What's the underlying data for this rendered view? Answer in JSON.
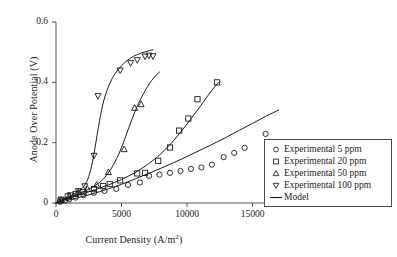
{
  "chart_data": {
    "type": "scatter",
    "title": "",
    "xlabel": "Current Density (A/m2)",
    "xlabel_base": "Current Density (A/m",
    "xlabel_sup": "2",
    "xlabel_tail": ")",
    "ylabel": "Anode Over Potential (V)",
    "xlim": [
      0,
      17500
    ],
    "ylim": [
      0,
      0.6
    ],
    "xticks": [
      0,
      5000,
      10000,
      15000
    ],
    "xtick_labels": [
      "0",
      "5000",
      "10000",
      "15000"
    ],
    "yticks": [
      0,
      0.2,
      0.4,
      0.6
    ],
    "ytick_labels": [
      "0",
      "0.2",
      "0.4",
      "0.6"
    ],
    "grid": false,
    "legend_position": "right-middle",
    "series": [
      {
        "name": "Experimental 5 ppm",
        "marker": "circle",
        "color": "#1a1a1a",
        "points": [
          [
            300,
            0.004
          ],
          [
            700,
            0.008
          ],
          [
            1000,
            0.012
          ],
          [
            1500,
            0.018
          ],
          [
            2100,
            0.026
          ],
          [
            2900,
            0.034
          ],
          [
            3700,
            0.04
          ],
          [
            4600,
            0.047
          ],
          [
            5500,
            0.06
          ],
          [
            6400,
            0.068
          ],
          [
            7100,
            0.09
          ],
          [
            7900,
            0.094
          ],
          [
            8700,
            0.1
          ],
          [
            9500,
            0.106
          ],
          [
            10300,
            0.113
          ],
          [
            11100,
            0.118
          ],
          [
            11900,
            0.127
          ],
          [
            12800,
            0.152
          ],
          [
            13600,
            0.166
          ],
          [
            14400,
            0.183
          ],
          [
            16000,
            0.229
          ]
        ]
      },
      {
        "name": "Experimental 20 ppm",
        "marker": "square",
        "color": "#1a1a1a",
        "points": [
          [
            350,
            0.008
          ],
          [
            900,
            0.022
          ],
          [
            1500,
            0.03
          ],
          [
            2100,
            0.036
          ],
          [
            2900,
            0.046
          ],
          [
            3600,
            0.056
          ],
          [
            4100,
            0.063
          ],
          [
            4900,
            0.075
          ],
          [
            6200,
            0.098
          ],
          [
            6800,
            0.1
          ],
          [
            7800,
            0.14
          ],
          [
            8700,
            0.184
          ],
          [
            9400,
            0.24
          ],
          [
            10100,
            0.28
          ],
          [
            10800,
            0.344
          ],
          [
            12300,
            0.4
          ]
        ]
      },
      {
        "name": "Experimental 50 ppm",
        "marker": "triangle-up",
        "color": "#1a1a1a",
        "points": [
          [
            400,
            0.01
          ],
          [
            1000,
            0.024
          ],
          [
            1700,
            0.036
          ],
          [
            2400,
            0.046
          ],
          [
            3100,
            0.06
          ],
          [
            4000,
            0.102
          ],
          [
            5200,
            0.178
          ],
          [
            6000,
            0.315
          ],
          [
            6500,
            0.327
          ]
        ]
      },
      {
        "name": "Experimental 100 ppm",
        "marker": "triangle-down",
        "color": "#1a1a1a",
        "points": [
          [
            400,
            0.012
          ],
          [
            1100,
            0.026
          ],
          [
            1700,
            0.04
          ],
          [
            2200,
            0.056
          ],
          [
            2900,
            0.157
          ],
          [
            3200,
            0.355
          ],
          [
            4900,
            0.44
          ],
          [
            5700,
            0.464
          ],
          [
            6200,
            0.474
          ],
          [
            6800,
            0.486
          ],
          [
            7100,
            0.489
          ],
          [
            7400,
            0.487
          ]
        ]
      }
    ],
    "model_curves": [
      {
        "name": "Model 5 ppm",
        "points": [
          [
            0,
            0.0
          ],
          [
            1000,
            0.01
          ],
          [
            2000,
            0.021
          ],
          [
            3000,
            0.033
          ],
          [
            4000,
            0.047
          ],
          [
            5000,
            0.062
          ],
          [
            6000,
            0.079
          ],
          [
            7000,
            0.097
          ],
          [
            8000,
            0.115
          ],
          [
            9000,
            0.134
          ],
          [
            10000,
            0.154
          ],
          [
            11000,
            0.175
          ],
          [
            12000,
            0.196
          ],
          [
            13000,
            0.218
          ],
          [
            14000,
            0.241
          ],
          [
            15000,
            0.264
          ],
          [
            16000,
            0.287
          ],
          [
            17000,
            0.308
          ]
        ]
      },
      {
        "name": "Model 20 ppm",
        "points": [
          [
            0,
            0.0
          ],
          [
            1000,
            0.016
          ],
          [
            2000,
            0.03
          ],
          [
            3000,
            0.044
          ],
          [
            4000,
            0.06
          ],
          [
            5000,
            0.078
          ],
          [
            6000,
            0.1
          ],
          [
            7000,
            0.128
          ],
          [
            8000,
            0.163
          ],
          [
            9000,
            0.208
          ],
          [
            10000,
            0.262
          ],
          [
            11000,
            0.32
          ],
          [
            11800,
            0.368
          ],
          [
            12400,
            0.4
          ]
        ]
      },
      {
        "name": "Model 50 ppm",
        "points": [
          [
            0,
            0.0
          ],
          [
            800,
            0.015
          ],
          [
            1600,
            0.029
          ],
          [
            2400,
            0.044
          ],
          [
            3000,
            0.058
          ],
          [
            3600,
            0.079
          ],
          [
            4200,
            0.113
          ],
          [
            4800,
            0.163
          ],
          [
            5300,
            0.218
          ],
          [
            5800,
            0.278
          ],
          [
            6300,
            0.33
          ],
          [
            6800,
            0.372
          ],
          [
            7200,
            0.4
          ],
          [
            7600,
            0.422
          ],
          [
            7900,
            0.434
          ]
        ]
      },
      {
        "name": "Model 100 ppm",
        "points": [
          [
            0,
            0.0
          ],
          [
            600,
            0.013
          ],
          [
            1200,
            0.026
          ],
          [
            1800,
            0.042
          ],
          [
            2200,
            0.06
          ],
          [
            2500,
            0.088
          ],
          [
            2800,
            0.14
          ],
          [
            3100,
            0.215
          ],
          [
            3400,
            0.29
          ],
          [
            3700,
            0.348
          ],
          [
            4100,
            0.395
          ],
          [
            4500,
            0.428
          ],
          [
            5000,
            0.455
          ],
          [
            5600,
            0.478
          ],
          [
            6200,
            0.492
          ],
          [
            6800,
            0.501
          ],
          [
            7400,
            0.508
          ]
        ]
      }
    ],
    "legend": [
      {
        "label": "Experimental 5 ppm",
        "marker": "circle"
      },
      {
        "label": "Experimental 20 ppm",
        "marker": "square"
      },
      {
        "label": "Experimental 50 ppm",
        "marker": "triangle-up"
      },
      {
        "label": "Experimental 100 ppm",
        "marker": "triangle-down"
      },
      {
        "label": "Model",
        "marker": "line"
      }
    ]
  },
  "colors": {
    "background": "#ffffff",
    "ink": "#1a1a1a",
    "axis": "#555555",
    "legend_border": "#4a4a4a"
  }
}
